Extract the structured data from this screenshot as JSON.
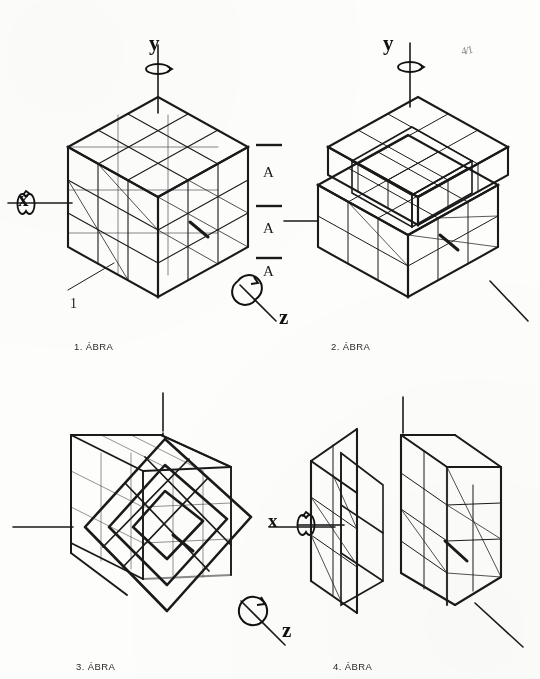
{
  "page": {
    "kind": "technical-drawing-sheet",
    "language": "hu",
    "background_color": "#fdfdfc",
    "ink_color": "#1a1a1a",
    "margin_note": "4/1"
  },
  "figures": [
    {
      "id": "fig1",
      "caption": "1. ÁBRA",
      "description": "3x3x3 cube in isometric view, complete, with x, y, z rotation axes",
      "axes": [
        {
          "name": "y",
          "label": "y",
          "position": "top",
          "rotation_arrow": true
        },
        {
          "name": "x",
          "label": "x",
          "position": "left",
          "rotation_arrow": true
        },
        {
          "name": "z",
          "label": "z",
          "position": "bottom-right",
          "rotation_arrow": true
        }
      ],
      "section_line": {
        "label": "A",
        "marks": [
          "A",
          "A",
          "A"
        ],
        "orientation": "vertical"
      },
      "callouts": [
        {
          "label": "1",
          "target": "front-bottom-left-corner"
        }
      ]
    },
    {
      "id": "fig2",
      "caption": "2. ÁBRA",
      "description": "Cube with top layer raised, one row displaced upward",
      "axes": [
        {
          "name": "y",
          "label": "y",
          "position": "top",
          "rotation_arrow": true
        }
      ],
      "section_line": null,
      "callouts": []
    },
    {
      "id": "fig3",
      "caption": "3. ÁBRA",
      "description": "Cube with inner lattice rotated 45 degrees about the z axis",
      "axes": [
        {
          "name": "z",
          "label": "z",
          "position": "bottom-right",
          "rotation_arrow": true
        }
      ],
      "section_line": null,
      "callouts": []
    },
    {
      "id": "fig4",
      "caption": "4. ÁBRA",
      "description": "Cube with a vertical side slice pulled out along the x axis",
      "axes": [
        {
          "name": "x",
          "label": "x",
          "position": "left",
          "rotation_arrow": true
        }
      ],
      "section_line": null,
      "callouts": []
    }
  ],
  "labels": {
    "y_top_left": "y",
    "y_top_right": "y",
    "x_left": "x",
    "z_fig1": "z",
    "z_fig3": "z",
    "x_fig4": "x",
    "section_a1": "A",
    "section_a2": "A",
    "section_a3": "A",
    "callout_1": "1",
    "cap1": "1. ÁBRA",
    "cap2": "2. ÁBRA",
    "cap3": "3. ÁBRA",
    "cap4": "4. ÁBRA",
    "margin_mark": "4/1"
  }
}
